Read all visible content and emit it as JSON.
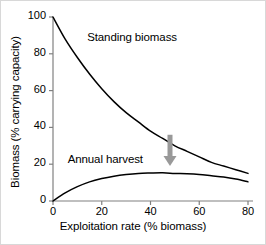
{
  "chart_data": {
    "type": "line",
    "title": "",
    "xlabel": "Exploitation rate (% biomass)",
    "ylabel": "Biomass (% carrying capacity)",
    "xlim": [
      0,
      80
    ],
    "ylim": [
      0,
      100
    ],
    "xticks": [
      0,
      20,
      40,
      60,
      80
    ],
    "yticks": [
      0,
      20,
      40,
      60,
      80,
      100
    ],
    "xtick_labels": [
      "0",
      "20",
      "40",
      "60",
      "80"
    ],
    "ytick_labels": [
      "0",
      "20",
      "40",
      "60",
      "80",
      "100"
    ],
    "grid": false,
    "legend": "inline-annotations",
    "axis_color": "#808080",
    "line_color": "#000000",
    "arrow_color": "#999999",
    "x": [
      0,
      5,
      10,
      15,
      20,
      25,
      30,
      35,
      40,
      45,
      50,
      55,
      60,
      65,
      70,
      75,
      80
    ],
    "series": [
      {
        "name": "Standing biomass",
        "values": [
          100,
          88,
          78,
          69,
          61,
          54,
          48,
          43,
          38,
          34,
          30,
          27,
          24,
          21,
          19,
          17,
          15
        ]
      },
      {
        "name": "Annual harvest",
        "values": [
          0,
          4.4,
          7.8,
          10.4,
          12.2,
          13.5,
          14.4,
          15.0,
          15.2,
          15.3,
          15.0,
          14.8,
          14.4,
          13.7,
          13.0,
          11.9,
          10.4
        ]
      }
    ],
    "annotations": [
      {
        "name": "down-arrow",
        "shape": "arrow-down",
        "x": 48,
        "y_start": 36,
        "y_end": 19,
        "color": "#999999"
      }
    ],
    "series_labels": [
      {
        "text": "Standing biomass",
        "x": 14,
        "y": 88
      },
      {
        "text": "Annual harvest",
        "x": 6,
        "y": 22
      }
    ]
  }
}
